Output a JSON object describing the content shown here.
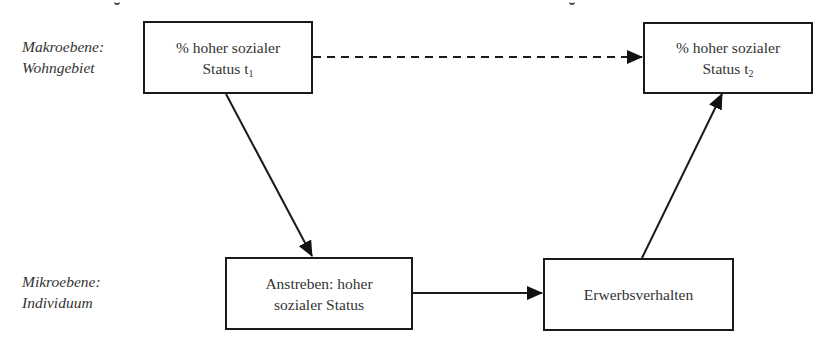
{
  "levels": {
    "macro": {
      "line1": "Makroebene:",
      "line2": "Wohngebiet"
    },
    "micro": {
      "line1": "Mikroebene:",
      "line2": "Individuum"
    }
  },
  "nodes": {
    "status_t1": {
      "line1": "% hoher sozialer",
      "line2_main": "Status t",
      "line2_sub": "1"
    },
    "status_t2": {
      "line1": "% hoher sozialer",
      "line2_main": "Status t",
      "line2_sub": "2"
    },
    "aspiration": {
      "line1": "Anstreben: hoher",
      "line2": "sozialer Status"
    },
    "employment": {
      "line1": "Erwerbsverhalten"
    }
  },
  "edges": [
    {
      "from": "status_t1",
      "to": "status_t2",
      "style": "dashed"
    },
    {
      "from": "status_t1",
      "to": "aspiration",
      "style": "solid"
    },
    {
      "from": "aspiration",
      "to": "employment",
      "style": "solid"
    },
    {
      "from": "employment",
      "to": "status_t2",
      "style": "solid"
    }
  ],
  "colors": {
    "stroke": "#1a1a1a",
    "text": "#333333",
    "background": "#ffffff"
  }
}
